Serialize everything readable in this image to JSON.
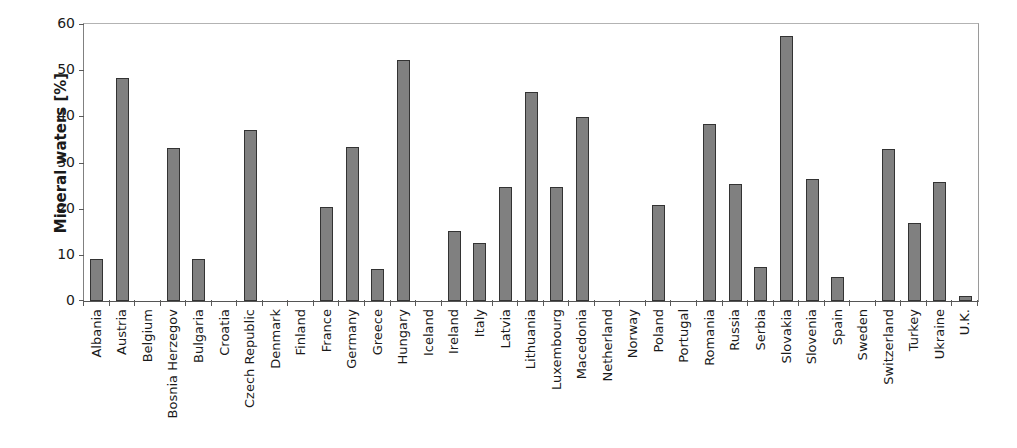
{
  "chart_data": {
    "type": "bar",
    "title": "",
    "xlabel": "",
    "ylabel": "Mineral waters [%]",
    "ylim": [
      0,
      60
    ],
    "yticks": [
      0,
      10,
      20,
      30,
      40,
      50,
      60
    ],
    "grid": false,
    "legend": null,
    "bar_color": "#808080",
    "bar_edge_color": "#333333",
    "categories": [
      "Albania",
      "Austria",
      "Belgium",
      "Bosnia Herzegov",
      "Bulgaria",
      "Croatia",
      "Czech Republic",
      "Denmark",
      "Finland",
      "France",
      "Germany",
      "Greece",
      "Hungary",
      "Iceland",
      "Ireland",
      "Italy",
      "Latvia",
      "Lithuania",
      "Luxembourg",
      "Macedonia",
      "Netherland",
      "Norway",
      "Poland",
      "Portugal",
      "Romania",
      "Russia",
      "Serbia",
      "Slovakia",
      "Slovenia",
      "Spain",
      "Sweden",
      "Switzerland",
      "Turkey",
      "Ukraine",
      "U.K."
    ],
    "values": [
      9.2,
      48.3,
      0,
      33.2,
      9.2,
      0,
      37.0,
      0,
      0,
      20.4,
      33.4,
      7.0,
      52.2,
      0,
      15.2,
      12.5,
      24.8,
      45.3,
      24.8,
      39.9,
      0,
      0,
      20.8,
      0,
      38.3,
      25.4,
      7.4,
      57.4,
      26.4,
      5.1,
      0,
      32.9,
      17.0,
      25.7,
      1.1
    ]
  }
}
